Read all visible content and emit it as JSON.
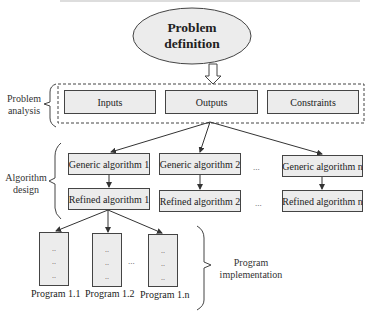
{
  "diagram": {
    "top_node": {
      "line1": "Problem",
      "line2": "definition",
      "shape": "ellipse"
    },
    "stages": [
      {
        "line1": "Problem",
        "line2": "analysis"
      },
      {
        "line1": "Algorithm",
        "line2": "design"
      },
      {
        "line1": "Program",
        "line2": "implementation"
      }
    ],
    "analysis_boxes": [
      "Inputs",
      "Outputs",
      "Constraints"
    ],
    "generic_algorithms": [
      "Generic algorithm 1",
      "Generic algorithm 2",
      "Generic algorithm n"
    ],
    "refined_algorithms": [
      "Refined algorithm 1",
      "Refined algorithm 2",
      "Refined algorithm n"
    ],
    "ellipsis": "...",
    "programs": [
      {
        "label": "Program 1.1",
        "content": ".."
      },
      {
        "label": "Program 1.2",
        "content": ".."
      },
      {
        "label": "Program 1.n",
        "content": ".."
      }
    ]
  },
  "colors": {
    "box_fill": "#ececec",
    "border": "#444444",
    "text": "#222222"
  }
}
